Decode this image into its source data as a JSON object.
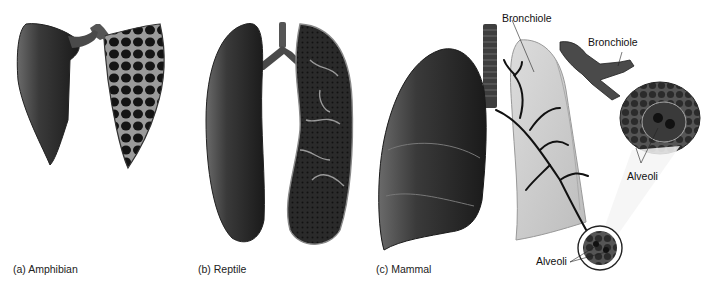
{
  "figure": {
    "panels": [
      {
        "id": "a",
        "caption": "(a) Amphibian"
      },
      {
        "id": "b",
        "caption": "(b) Reptile"
      },
      {
        "id": "c",
        "caption": "(c) Mammal"
      }
    ],
    "mammal_labels": {
      "bronchiole_top": "Bronchiole",
      "bronchiole_right": "Bronchiole",
      "alveoli_right": "Alveoli",
      "alveoli_bottom": "Alveoli"
    }
  }
}
